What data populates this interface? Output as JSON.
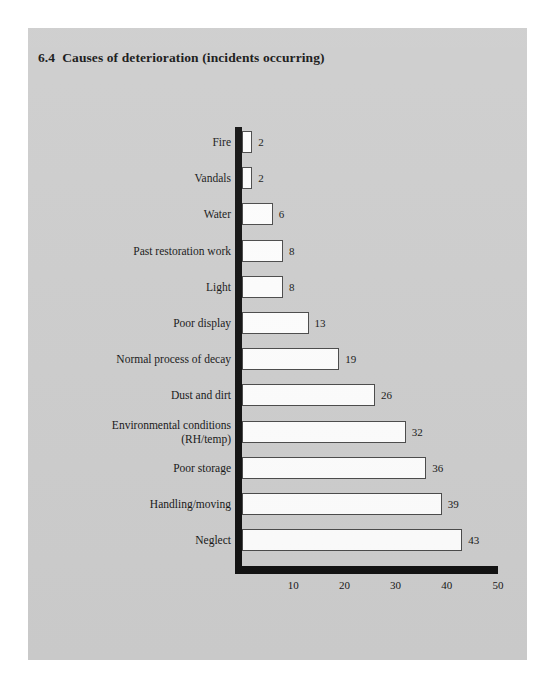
{
  "figure": {
    "number": "6.4",
    "title": "Causes of deterioration (incidents occurring)"
  },
  "chart_data": {
    "type": "bar",
    "orientation": "horizontal",
    "xlabel": "",
    "ylabel": "",
    "xlim": [
      0,
      50
    ],
    "xticks": [
      "10",
      "20",
      "30",
      "40",
      "50"
    ],
    "xtick_values": [
      10,
      20,
      30,
      40,
      50
    ],
    "grid": false,
    "legend": false,
    "categories": [
      "Fire",
      "Vandals",
      "Water",
      "Past restoration work",
      "Light",
      "Poor display",
      "Normal process of decay",
      "Dust and dirt",
      "Environmental conditions\n(RH/temp)",
      "Poor storage",
      "Handling/moving",
      "Neglect"
    ],
    "values": [
      2,
      2,
      6,
      8,
      8,
      13,
      19,
      26,
      32,
      36,
      39,
      43
    ],
    "value_labels": [
      "2",
      "2",
      "6",
      "8",
      "8",
      "13",
      "19",
      "26",
      "32",
      "36",
      "39",
      "43"
    ],
    "colors": {
      "page_background": "#cdcdcd",
      "outer_background": "#ffffff",
      "bar_fill": "#fdfdfd",
      "bar_stroke": "#4a4a4a",
      "axis": "#111111",
      "text": "#161616"
    }
  }
}
